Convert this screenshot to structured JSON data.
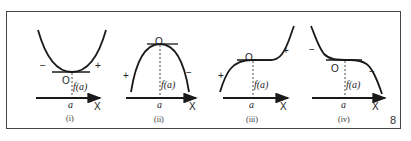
{
  "figure": {
    "number": "8",
    "panels": [
      {
        "id": "i",
        "caption": "(i)",
        "curve": "minimum (concave up)",
        "left_sign": "−",
        "right_sign": "+",
        "point_label": "O",
        "value_label": "f(a)",
        "x_point": "a",
        "axis_label": "X"
      },
      {
        "id": "ii",
        "caption": "(ii)",
        "curve": "maximum (concave down)",
        "left_sign": "+",
        "right_sign": "−",
        "point_label": "O",
        "value_label": "f(a)",
        "x_point": "a",
        "axis_label": "X"
      },
      {
        "id": "iii",
        "caption": "(iii)",
        "curve": "increasing inflection",
        "left_sign": "+",
        "right_sign": "+",
        "point_label": "O",
        "value_label": "f(a)",
        "x_point": "a",
        "axis_label": "X"
      },
      {
        "id": "iv",
        "caption": "(iv)",
        "curve": "decreasing inflection",
        "left_sign": "−",
        "right_sign": "−",
        "point_label": "O",
        "value_label": "f(a)",
        "x_point": "a",
        "axis_label": "X"
      }
    ]
  }
}
